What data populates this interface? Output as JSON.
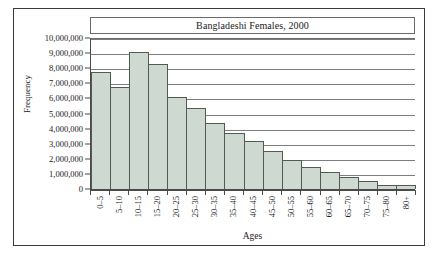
{
  "chart_data": {
    "type": "bar",
    "title": "Bangladeshi Females, 2000",
    "xlabel": "Ages",
    "ylabel": "Frequency",
    "ylim": [
      0,
      10000000
    ],
    "ytick_step": 1000000,
    "grid": true,
    "legend": null,
    "categories": [
      "0–5",
      "5–10",
      "10–15",
      "15–20",
      "20–25",
      "25–30",
      "30–35",
      "35–40",
      "40–45",
      "45–50",
      "50–55",
      "55–60",
      "60–65",
      "65–70",
      "70–75",
      "75–80",
      "80+"
    ],
    "values": [
      7750000,
      6750000,
      9100000,
      8250000,
      6100000,
      5350000,
      4350000,
      3700000,
      3200000,
      2500000,
      1900000,
      1450000,
      1100000,
      800000,
      500000,
      250000,
      240000
    ],
    "ytick_labels": [
      "10,000,000",
      "9,000,000",
      "8,000,000",
      "7,000,000",
      "6,000,000",
      "5,000,000",
      "4,000,000",
      "3,000,000",
      "2,000,000",
      "1,000,000",
      "0"
    ],
    "ytick_values": [
      10000000,
      9000000,
      8000000,
      7000000,
      6000000,
      5000000,
      4000000,
      3000000,
      2000000,
      1000000,
      0
    ],
    "bar_color": "#ced9d1",
    "bar_edge_color": "#4f5b53",
    "axis_color": "#4a4a4a",
    "grid_color": "#7d7d7d",
    "background": "#ffffff"
  }
}
